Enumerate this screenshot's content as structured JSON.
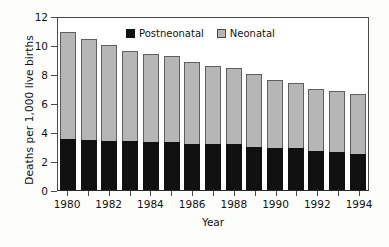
{
  "chart_data": {
    "type": "bar",
    "subtype": "stacked-vertical",
    "title": "",
    "xlabel": "Year",
    "ylabel": "Deaths per 1,000 live births",
    "ylim": [
      0,
      12
    ],
    "yticks": [
      0,
      2,
      4,
      6,
      8,
      10,
      12
    ],
    "ytick_labels": [
      "0",
      "2",
      "4",
      "6",
      "8",
      "10",
      "12"
    ],
    "grid": false,
    "legend_position": "top-center-inside",
    "categories": [
      "1980",
      "1981",
      "1982",
      "1983",
      "1984",
      "1985",
      "1986",
      "1987",
      "1988",
      "1989",
      "1990",
      "1991",
      "1992",
      "1993",
      "1994"
    ],
    "xtick_labels": [
      "1980",
      "",
      "1982",
      "",
      "1984",
      "",
      "1986",
      "",
      "1988",
      "",
      "1990",
      "",
      "1992",
      "",
      "1994"
    ],
    "series": [
      {
        "name": "Postneonatal",
        "color": "#111111",
        "values": [
          3.55,
          3.48,
          3.38,
          3.38,
          3.31,
          3.31,
          3.19,
          3.19,
          3.19,
          3.0,
          2.92,
          2.92,
          2.7,
          2.62,
          2.5
        ]
      },
      {
        "name": "Neonatal",
        "color": "#b6b6b6",
        "values": [
          7.35,
          6.92,
          6.62,
          6.22,
          6.04,
          5.94,
          5.62,
          5.34,
          5.22,
          5.0,
          4.68,
          4.43,
          4.25,
          4.2,
          4.14
        ]
      }
    ],
    "totals": [
      10.9,
      10.4,
      10.0,
      9.6,
      9.35,
      9.25,
      8.81,
      8.53,
      8.41,
      8.0,
      7.6,
      7.35,
      6.95,
      6.82,
      6.64
    ],
    "legend": [
      {
        "label": "Postneonatal",
        "color": "#111111"
      },
      {
        "label": "Neonatal",
        "color": "#b6b6b6"
      }
    ]
  }
}
